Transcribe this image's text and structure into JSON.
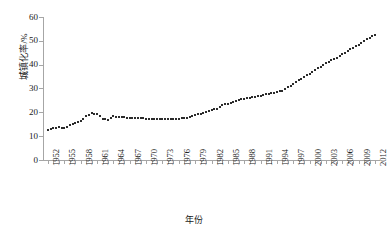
{
  "chart_data": {
    "type": "line",
    "title": "",
    "xlabel": "年份",
    "ylabel": "城镇化率/%",
    "ylim": [
      0,
      60
    ],
    "ytick_labels": [
      "0",
      "10",
      "20",
      "30",
      "40",
      "50",
      "60"
    ],
    "ytick_values": [
      0,
      10,
      20,
      30,
      40,
      50,
      60
    ],
    "xtick_labels": [
      "1952",
      "1955",
      "1958",
      "1961",
      "1964",
      "1967",
      "1970",
      "1973",
      "1976",
      "1979",
      "1982",
      "1985",
      "1988",
      "1991",
      "1994",
      "1997",
      "2000",
      "2003",
      "2006",
      "2009",
      "2012"
    ],
    "xlim": [
      1952,
      2012
    ],
    "grid": false,
    "legend": false,
    "marker": "small-square",
    "marker_color": "#2b2b2b",
    "axis_color": "#a6a6a6",
    "x": [
      1952,
      1953,
      1954,
      1955,
      1956,
      1957,
      1958,
      1959,
      1960,
      1961,
      1962,
      1963,
      1964,
      1965,
      1966,
      1967,
      1968,
      1969,
      1970,
      1971,
      1972,
      1973,
      1974,
      1975,
      1976,
      1977,
      1978,
      1979,
      1980,
      1981,
      1982,
      1983,
      1984,
      1985,
      1986,
      1987,
      1988,
      1989,
      1990,
      1991,
      1992,
      1993,
      1994,
      1995,
      1996,
      1997,
      1998,
      1999,
      2000,
      2001,
      2002,
      2003,
      2004,
      2005,
      2006,
      2007,
      2008,
      2009,
      2010,
      2011,
      2012
    ],
    "values": [
      12.5,
      13.3,
      13.7,
      13.5,
      14.6,
      15.4,
      16.2,
      18.4,
      19.7,
      19.3,
      17.3,
      16.8,
      18.4,
      18.0,
      17.9,
      17.7,
      17.6,
      17.5,
      17.4,
      17.3,
      17.1,
      17.2,
      17.2,
      17.3,
      17.4,
      17.6,
      17.9,
      19.0,
      19.4,
      20.2,
      21.1,
      21.6,
      23.0,
      23.7,
      24.5,
      25.3,
      25.8,
      26.2,
      26.4,
      26.9,
      27.5,
      28.0,
      28.5,
      29.0,
      30.5,
      31.9,
      33.4,
      34.8,
      36.2,
      37.7,
      39.1,
      40.5,
      41.8,
      43.0,
      44.3,
      45.9,
      47.0,
      48.3,
      49.9,
      51.3,
      52.6
    ]
  },
  "axis_titles": {
    "y": "城镇化率/%",
    "x": "年份"
  }
}
